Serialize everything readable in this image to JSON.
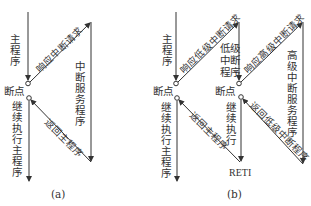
{
  "diagram": {
    "panel_a": {
      "caption": "(a)",
      "main_program": "主程序",
      "breakpoint": "断点",
      "respond_interrupt": "响应中断请求",
      "interrupt_service": "中断服务程序",
      "return_main": "返回主程序",
      "continue_main": "继续执行主程序"
    },
    "panel_b": {
      "caption": "(b)",
      "main_program": "主程序",
      "breakpoint_main": "断点",
      "respond_low": "响应低级中断请求",
      "low_program": "低级中断程序",
      "breakpoint_low": "断点",
      "respond_high": "响应高级中断请求",
      "high_service": "高级中断服务程序",
      "return_low": "返回低级中断程序",
      "continue_exec": "继续执行",
      "reti": "RETI",
      "return_main": "返回主程序",
      "continue_main": "继续执行主程序"
    }
  }
}
